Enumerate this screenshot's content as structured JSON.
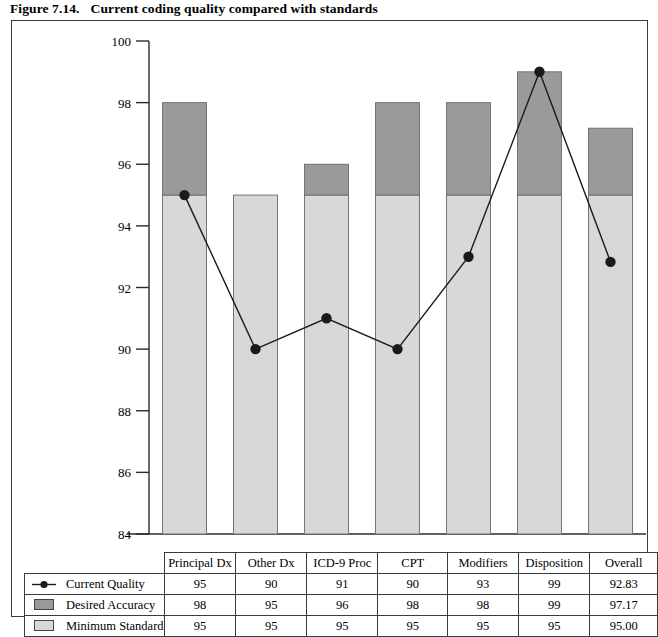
{
  "caption": {
    "number": "Figure 7.14.",
    "title": "Current coding quality compared with standards"
  },
  "chart_data": {
    "type": "bar",
    "title": "Current coding quality compared with standards",
    "xlabel": "",
    "ylabel": "",
    "ylim": [
      84,
      100
    ],
    "ytick_step": 2,
    "yticks": [
      "100",
      "98",
      "96",
      "94",
      "92",
      "90",
      "88",
      "86",
      "84"
    ],
    "grid": false,
    "legend_position": "table-left",
    "stacked": true,
    "categories": [
      "Principal Dx",
      "Other Dx",
      "ICD-9 Proc",
      "CPT",
      "Modifiers",
      "Disposition",
      "Overall"
    ],
    "series": [
      {
        "name": "Current Quality",
        "render": "line",
        "marker": "filled-circle",
        "color": "#1a1a1a",
        "values": [
          95,
          90,
          91,
          90,
          93,
          99,
          92.83
        ],
        "labels": [
          "95",
          "90",
          "91",
          "90",
          "93",
          "99",
          "92.83"
        ]
      },
      {
        "name": "Desired Accuracy",
        "render": "bar-top",
        "color": "#9a9a9a",
        "values": [
          98,
          95,
          96,
          98,
          98,
          99,
          97.17
        ],
        "labels": [
          "98",
          "95",
          "96",
          "98",
          "98",
          "99",
          "97.17"
        ]
      },
      {
        "name": "Minimum Standard",
        "render": "bar-base",
        "color": "#d8d8d8",
        "values": [
          95,
          95,
          95,
          95,
          95,
          95,
          95.0
        ],
        "labels": [
          "95",
          "95",
          "95",
          "95",
          "95",
          "95",
          "95.00"
        ]
      }
    ]
  },
  "table": {
    "corner_label": "",
    "column_headers": [
      "Principal Dx",
      "Other Dx",
      "ICD-9 Proc",
      "CPT",
      "Modifiers",
      "Disposition",
      "Overall"
    ],
    "rows": [
      {
        "key": "line-marker",
        "label": "Current Quality",
        "values": [
          "95",
          "90",
          "91",
          "90",
          "93",
          "99",
          "92.83"
        ]
      },
      {
        "key": "dark-swatch",
        "label": "Desired Accuracy",
        "values": [
          "98",
          "95",
          "96",
          "98",
          "98",
          "99",
          "97.17"
        ]
      },
      {
        "key": "light-swatch",
        "label": "Minimum Standard",
        "values": [
          "95",
          "95",
          "95",
          "95",
          "95",
          "95",
          "95.00"
        ]
      }
    ]
  },
  "colors": {
    "desired_accuracy": "#9a9a9a",
    "minimum_standard": "#d8d8d8",
    "line": "#1a1a1a",
    "frame": "#3b3b3b"
  }
}
